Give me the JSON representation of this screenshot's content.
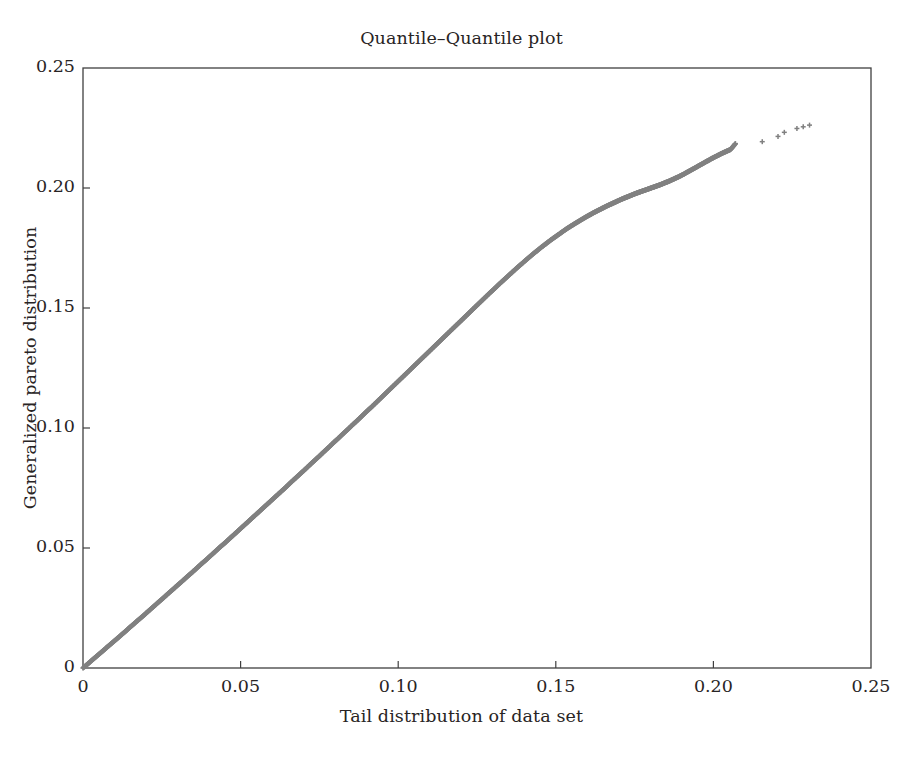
{
  "chart_data": {
    "type": "scatter",
    "title": "Quantile–Quantile plot",
    "xlabel": "Tail distribution of data set",
    "ylabel": "Generalized pareto distribution",
    "xlim": [
      0,
      0.25
    ],
    "ylim": [
      0,
      0.25
    ],
    "xticks": [
      "0",
      "0.05",
      "0.10",
      "0.15",
      "0.20",
      "0.25"
    ],
    "xtick_values": [
      0,
      0.05,
      0.1,
      0.15,
      0.2,
      0.25
    ],
    "yticks": [
      "0",
      "0.05",
      "0.10",
      "0.15",
      "0.20",
      "0.25"
    ],
    "ytick_values": [
      0,
      0.05,
      0.1,
      0.15,
      0.2,
      0.25
    ],
    "grid": false,
    "legend": null,
    "marker": "plus-cross",
    "marker_color": "#808080",
    "marker_size": 5,
    "series": [
      {
        "name": "Quantile pairs",
        "x": [
          0.0,
          0.0015,
          0.003,
          0.0045,
          0.006,
          0.0075,
          0.009,
          0.0105,
          0.012,
          0.0135,
          0.015,
          0.0165,
          0.018,
          0.0195,
          0.021,
          0.0225,
          0.024,
          0.0255,
          0.027,
          0.0285,
          0.03,
          0.0315,
          0.033,
          0.0345,
          0.036,
          0.0375,
          0.039,
          0.0405,
          0.042,
          0.0435,
          0.045,
          0.0465,
          0.048,
          0.0495,
          0.051,
          0.0525,
          0.054,
          0.0555,
          0.057,
          0.0585,
          0.06,
          0.0615,
          0.063,
          0.0645,
          0.066,
          0.0675,
          0.069,
          0.0705,
          0.072,
          0.0735,
          0.075,
          0.0765,
          0.078,
          0.0795,
          0.081,
          0.0825,
          0.084,
          0.0855,
          0.087,
          0.0885,
          0.09,
          0.0915,
          0.093,
          0.0945,
          0.096,
          0.0975,
          0.099,
          0.1005,
          0.102,
          0.1035,
          0.105,
          0.1065,
          0.108,
          0.1095,
          0.111,
          0.1125,
          0.114,
          0.1155,
          0.117,
          0.1185,
          0.12,
          0.1215,
          0.123,
          0.1245,
          0.126,
          0.1275,
          0.129,
          0.1305,
          0.132,
          0.1335,
          0.135,
          0.1365,
          0.138,
          0.1395,
          0.141,
          0.1425,
          0.144,
          0.1455,
          0.147,
          0.1485,
          0.15,
          0.1515,
          0.153,
          0.1545,
          0.156,
          0.1575,
          0.159,
          0.1605,
          0.162,
          0.1635,
          0.165,
          0.1665,
          0.168,
          0.1695,
          0.171,
          0.1725,
          0.174,
          0.1755,
          0.177,
          0.1785,
          0.18,
          0.1815,
          0.183,
          0.1845,
          0.186,
          0.1875,
          0.189,
          0.1905,
          0.192,
          0.1935,
          0.195,
          0.1965,
          0.198,
          0.1995,
          0.201,
          0.2025,
          0.204,
          0.2055,
          0.207
        ],
        "y": [
          0.0,
          0.0017,
          0.0034,
          0.0051,
          0.0068,
          0.0085,
          0.0102,
          0.0119,
          0.0136,
          0.0153,
          0.0171,
          0.0188,
          0.0205,
          0.0222,
          0.024,
          0.0257,
          0.0275,
          0.0292,
          0.031,
          0.0327,
          0.0345,
          0.0362,
          0.038,
          0.0397,
          0.0415,
          0.0433,
          0.045,
          0.0468,
          0.0486,
          0.0504,
          0.0521,
          0.0539,
          0.0557,
          0.0575,
          0.0593,
          0.0611,
          0.0629,
          0.0647,
          0.0665,
          0.0683,
          0.0701,
          0.0719,
          0.0737,
          0.0755,
          0.0774,
          0.0792,
          0.081,
          0.0828,
          0.0847,
          0.0865,
          0.0883,
          0.0902,
          0.092,
          0.0939,
          0.0957,
          0.0976,
          0.0994,
          0.1013,
          0.1031,
          0.105,
          0.1069,
          0.1087,
          0.1106,
          0.1125,
          0.1144,
          0.1163,
          0.1182,
          0.1201,
          0.122,
          0.1239,
          0.1258,
          0.1277,
          0.1296,
          0.1315,
          0.1334,
          0.1353,
          0.1372,
          0.1391,
          0.141,
          0.1429,
          0.1448,
          0.1467,
          0.1486,
          0.1505,
          0.1524,
          0.1543,
          0.1562,
          0.158,
          0.1599,
          0.1617,
          0.1635,
          0.1653,
          0.1671,
          0.1688,
          0.1705,
          0.1722,
          0.1738,
          0.1754,
          0.1769,
          0.1784,
          0.1798,
          0.1812,
          0.1826,
          0.1839,
          0.1851,
          0.1863,
          0.1875,
          0.1886,
          0.1897,
          0.1907,
          0.1917,
          0.1927,
          0.1936,
          0.1945,
          0.1954,
          0.1962,
          0.197,
          0.1978,
          0.1985,
          0.1992,
          0.1999,
          0.2006,
          0.2013,
          0.2021,
          0.2029,
          0.2038,
          0.2047,
          0.2057,
          0.2068,
          0.2079,
          0.209,
          0.2101,
          0.2112,
          0.2123,
          0.2133,
          0.2143,
          0.2152,
          0.2161,
          0.2185
        ],
        "outlier_x": [
          0.2155,
          0.2205,
          0.2225,
          0.2265,
          0.2285,
          0.2305
        ],
        "outlier_y": [
          0.2193,
          0.2215,
          0.2232,
          0.2248,
          0.2255,
          0.2262
        ]
      }
    ]
  }
}
